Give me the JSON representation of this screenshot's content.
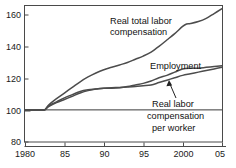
{
  "chart_data": {
    "type": "line",
    "title": "",
    "subtitle": "",
    "xlabel": "",
    "ylabel": "",
    "xlim": [
      1980,
      2005
    ],
    "ylim": [
      80,
      165
    ],
    "yticks": [
      80,
      100,
      120,
      140,
      160
    ],
    "ytick_labels": [
      "80",
      "100",
      "120",
      "140",
      "160"
    ],
    "xticks": [
      1980,
      1985,
      1990,
      1995,
      2000,
      2005
    ],
    "xtick_labels": [
      "1980",
      "85",
      "90",
      "95",
      "2000",
      "05"
    ],
    "grid": false,
    "legend_position": "inline-annotations",
    "index_base_note": "index = 100 at 1982",
    "baseline_value": 100,
    "series": [
      {
        "name": "Real total labor compensation",
        "label_text_lines": [
          "Real total labor",
          "compensation"
        ],
        "x": [
          1980,
          1981,
          1982,
          1982.5,
          1983,
          1984,
          1985,
          1986,
          1987,
          1988,
          1989,
          1990,
          1991,
          1992,
          1993,
          1994,
          1995,
          1996,
          1997,
          1998,
          1999,
          2000,
          2000.5,
          2001,
          2002,
          2003,
          2004,
          2005
        ],
        "values": [
          100,
          100,
          100,
          100,
          103,
          107,
          110.5,
          114,
          117.5,
          120.5,
          123,
          125,
          126.5,
          128,
          129.5,
          131.5,
          133.5,
          136,
          139.5,
          143.5,
          147.5,
          152,
          153.5,
          153.8,
          155,
          157,
          160,
          163
        ]
      },
      {
        "name": "Employment",
        "label_text_lines": [
          "Employment"
        ],
        "x": [
          1980,
          1981,
          1982,
          1982.5,
          1983,
          1984,
          1985,
          1986,
          1987,
          1988,
          1989,
          1990,
          1991,
          1992,
          1993,
          1994,
          1995,
          1996,
          1997,
          1998,
          1999,
          2000,
          2001,
          2002,
          2003,
          2004,
          2005
        ],
        "values": [
          100,
          100,
          100,
          100,
          102,
          104.5,
          106.5,
          108.5,
          110.5,
          112,
          113,
          113.5,
          113.5,
          113.8,
          114.5,
          115.5,
          116.5,
          118,
          120,
          121.5,
          123.5,
          125.5,
          126,
          126,
          126.5,
          127,
          127.5
        ]
      },
      {
        "name": "Real labor compensation per worker",
        "label_text_lines": [
          "Real labor",
          "compensation",
          "per worker"
        ],
        "x": [
          1980,
          1981,
          1982,
          1982.5,
          1983,
          1984,
          1985,
          1986,
          1987,
          1988,
          1989,
          1990,
          1991,
          1992,
          1993,
          1994,
          1995,
          1996,
          1997,
          1998,
          1999,
          2000,
          2001,
          2002,
          2003,
          2004,
          2005
        ],
        "values": [
          100,
          100,
          100,
          100,
          102.5,
          105,
          107.5,
          109.5,
          111.5,
          112.5,
          113,
          113.5,
          113.8,
          114,
          114.2,
          114.5,
          115,
          115.5,
          117,
          118.5,
          120,
          121.5,
          122.5,
          123.5,
          124.5,
          125.5,
          126.5
        ]
      }
    ],
    "annotations": [
      {
        "name": "real-total-labor-compensation-label",
        "lines": [
          "Real total labor",
          "compensation"
        ],
        "x_px": 110,
        "y_px": 20
      },
      {
        "name": "employment-label",
        "lines": [
          "Employment"
        ],
        "x_px": 150,
        "y_px": 66
      },
      {
        "name": "real-labor-compensation-per-worker-label",
        "lines": [
          "Real labor",
          "compensation",
          "per worker"
        ],
        "x_px": 152,
        "y_px": 105
      }
    ],
    "colors": {
      "line": "#4c4c4c",
      "frame": "#4a4a4a",
      "text": "#111111",
      "background": "#ffffff"
    }
  }
}
